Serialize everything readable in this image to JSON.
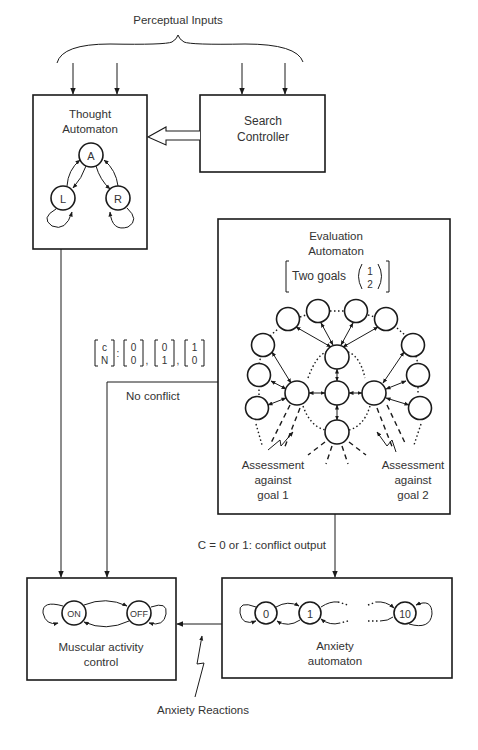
{
  "diagram": {
    "perceptual_inputs": "Perceptual Inputs",
    "thought_automaton": {
      "title_line1": "Thought",
      "title_line2": "Automaton",
      "states": [
        "A",
        "L",
        "R"
      ]
    },
    "search_controller": {
      "line1": "Search",
      "line2": "Controller"
    },
    "evaluation_automaton": {
      "title_line1": "Evaluation",
      "title_line2": "Automaton",
      "goals_label": "Two goals",
      "goal_1": "1",
      "goal_2": "2",
      "assessment_1_line1": "Assessment",
      "assessment_1_line2": "against",
      "assessment_1_line3": "goal 1",
      "assessment_2_line1": "Assessment",
      "assessment_2_line2": "against",
      "assessment_2_line3": "goal 2"
    },
    "signal_vector": {
      "var_top": "c",
      "var_bottom": "N",
      "colon": ":",
      "v1_top": "0",
      "v1_bottom": "0",
      "v2_top": "0",
      "v2_bottom": "1",
      "v3_top": "1",
      "v3_bottom": "0"
    },
    "no_conflict": "No conflict",
    "conflict_output": "C  =  0 or 1: conflict output",
    "muscular_control": {
      "line1": "Muscular activity",
      "line2": "control",
      "states": [
        "ON",
        "OFF"
      ]
    },
    "anxiety_automaton": {
      "line1": "Anxiety",
      "line2": "automaton",
      "states": [
        "0",
        "1",
        "10"
      ]
    },
    "anxiety_reactions": "Anxiety Reactions"
  }
}
